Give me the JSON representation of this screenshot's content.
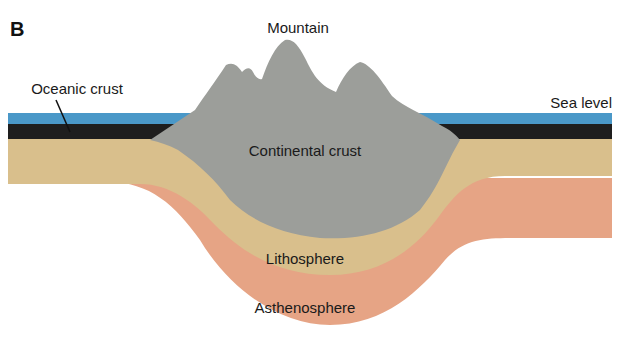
{
  "figure": {
    "panel_label": "B",
    "labels": {
      "mountain": "Mountain",
      "oceanic_crust": "Oceanic crust",
      "sea_level": "Sea level",
      "continental_crust": "Continental crust",
      "lithosphere": "Lithosphere",
      "asthenosphere": "Asthenosphere"
    },
    "colors": {
      "sea": "#4a98c8",
      "oceanic_crust": "#1e1e1e",
      "continental_crust": "#9c9e9a",
      "lithosphere": "#d9bf8c",
      "asthenosphere": "#e6a485",
      "background": "#ffffff"
    }
  }
}
